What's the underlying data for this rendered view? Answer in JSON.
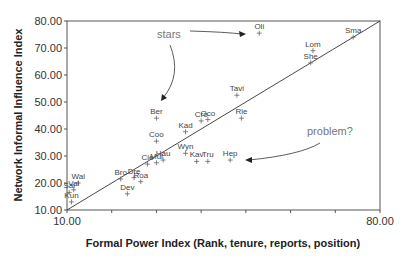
{
  "chart_data": {
    "type": "scatter",
    "title": "",
    "xlabel": "Formal Power Index (Rank, tenure, reports, position)",
    "ylabel": "Network Informal Influence Index",
    "xlim": [
      10,
      80
    ],
    "ylim": [
      10,
      80
    ],
    "x_ticks": [
      "10.00",
      "80.00"
    ],
    "y_ticks": [
      "10.00",
      "20.00",
      "30.00",
      "40.00",
      "50.00",
      "60.00",
      "70.00",
      "80.00"
    ],
    "grid": false,
    "reference_line": {
      "from": [
        10,
        10
      ],
      "to": [
        80,
        80
      ]
    },
    "points": [
      {
        "label": "Oli",
        "x": 53,
        "y": 75.5
      },
      {
        "label": "Sma",
        "x": 74,
        "y": 74
      },
      {
        "label": "Lom",
        "x": 65,
        "y": 69
      },
      {
        "label": "She",
        "x": 64.5,
        "y": 64.5
      },
      {
        "label": "Tavi",
        "x": 48,
        "y": 52.5
      },
      {
        "label": "Rie",
        "x": 49,
        "y": 44
      },
      {
        "label": "Ber",
        "x": 30,
        "y": 44
      },
      {
        "label": "Cro",
        "x": 40,
        "y": 43
      },
      {
        "label": "Oco",
        "x": 41.5,
        "y": 43.5
      },
      {
        "label": "Kad",
        "x": 36.5,
        "y": 39
      },
      {
        "label": "Coo",
        "x": 30,
        "y": 35.5
      },
      {
        "label": "Wyn",
        "x": 36.5,
        "y": 31
      },
      {
        "label": "Kav",
        "x": 39,
        "y": 28
      },
      {
        "label": "Tru",
        "x": 41.5,
        "y": 28
      },
      {
        "label": "Hep",
        "x": 46.5,
        "y": 28.5
      },
      {
        "label": "Hau",
        "x": 31.5,
        "y": 28.5
      },
      {
        "label": "Mul",
        "x": 30,
        "y": 27.5
      },
      {
        "label": "Cie",
        "x": 28,
        "y": 27
      },
      {
        "label": "Dre",
        "x": 25,
        "y": 22
      },
      {
        "label": "Roa",
        "x": 26.5,
        "y": 20.5
      },
      {
        "label": "Bro",
        "x": 22,
        "y": 21.5
      },
      {
        "label": "Dev",
        "x": 23.5,
        "y": 16
      },
      {
        "label": "Wal",
        "x": 12.5,
        "y": 20
      },
      {
        "label": "Val",
        "x": 11.5,
        "y": 17.5
      },
      {
        "label": "Sal",
        "x": 10.5,
        "y": 16.5
      },
      {
        "label": "Kun",
        "x": 11,
        "y": 13
      }
    ],
    "annotations": [
      {
        "text": "stars",
        "arrows_to": [
          "Oli",
          "Ber"
        ]
      },
      {
        "text": "problem?",
        "arrows_to": [
          "Hep"
        ]
      }
    ]
  }
}
